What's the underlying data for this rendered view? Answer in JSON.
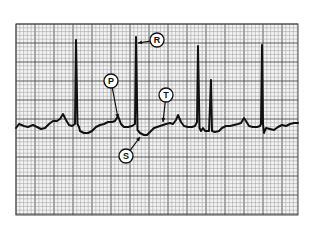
{
  "figure": {
    "type": "ecg_strip",
    "colors": {
      "background": "#ffffff",
      "grid_minor": "#9a9a9a",
      "grid_major": "#4a4a4a",
      "trace": "#111111",
      "label_fill": "#ffffff",
      "label_stroke": "#111111"
    },
    "grid": {
      "x0": 16,
      "y0": 24,
      "x1": 298,
      "y1": 215,
      "minor": 3.8,
      "major": 19
    },
    "labels": [
      {
        "id": "R",
        "text": "R",
        "cx": 157,
        "cy": 40,
        "arrow_to": [
          138,
          43
        ]
      },
      {
        "id": "P",
        "text": "P",
        "cx": 111,
        "cy": 81,
        "arrow_to": [
          118,
          118
        ]
      },
      {
        "id": "T",
        "text": "T",
        "cx": 166,
        "cy": 95,
        "arrow_to": [
          163,
          122
        ]
      },
      {
        "id": "S",
        "text": "S",
        "cx": 126,
        "cy": 156,
        "arrow_to": [
          140,
          137
        ]
      }
    ]
  }
}
